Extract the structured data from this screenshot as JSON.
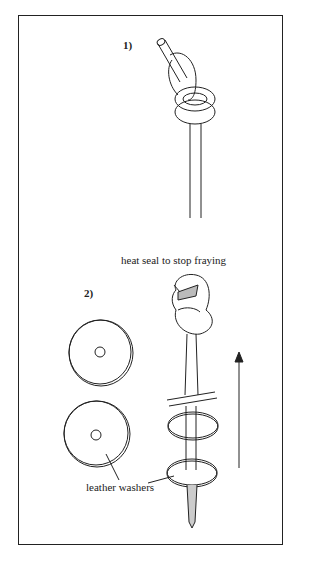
{
  "diagram": {
    "steps": [
      {
        "label": "1)"
      },
      {
        "label": "2)"
      }
    ],
    "annotations": {
      "heat_seal": "heat seal to stop fraying",
      "washers": "leather washers"
    }
  }
}
